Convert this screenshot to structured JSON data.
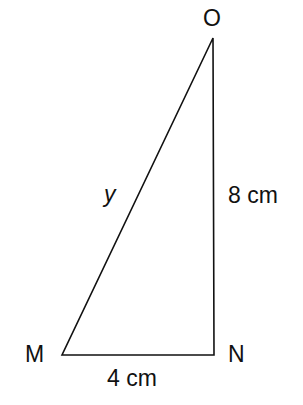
{
  "diagram": {
    "type": "right-triangle",
    "vertices": {
      "O": {
        "label": "O",
        "x": 213,
        "y": 38
      },
      "N": {
        "label": "N",
        "x": 214,
        "y": 355
      },
      "M": {
        "label": "M",
        "x": 62,
        "y": 355
      }
    },
    "right_angle_at": "N",
    "sides": {
      "MO": {
        "label": "y"
      },
      "ON": {
        "label": "8 cm"
      },
      "MN": {
        "label": "4 cm"
      }
    },
    "line_color": "#111111"
  }
}
